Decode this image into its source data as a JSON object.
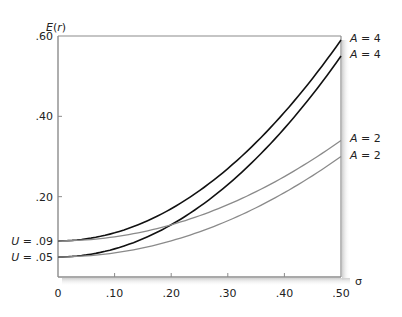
{
  "chart_data": {
    "type": "line",
    "title": "",
    "xlabel": "σ",
    "ylabel": "E(r)",
    "xlim": [
      0,
      0.5
    ],
    "ylim": [
      0,
      0.6
    ],
    "grid": false,
    "legend": "inline labels at right end of each curve",
    "x_ticks": [
      {
        "value": 0,
        "label": "0"
      },
      {
        "value": 0.1,
        "label": ".10"
      },
      {
        "value": 0.2,
        "label": ".20"
      },
      {
        "value": 0.3,
        "label": ".30"
      },
      {
        "value": 0.4,
        "label": ".40"
      },
      {
        "value": 0.5,
        "label": ".50"
      }
    ],
    "y_ticks": [
      {
        "value": 0.2,
        "label": ".20"
      },
      {
        "value": 0.4,
        "label": ".40"
      },
      {
        "value": 0.6,
        "label": ".60"
      }
    ],
    "intercept_labels": [
      {
        "value": 0.09,
        "label": "U = .09"
      },
      {
        "value": 0.05,
        "label": "U = .05"
      }
    ],
    "formula": "E(r) = U + 0.5 * A * σ^2",
    "x": [
      0,
      0.05,
      0.1,
      0.15,
      0.2,
      0.25,
      0.3,
      0.35,
      0.4,
      0.45,
      0.5
    ],
    "series": [
      {
        "name": "A = 4",
        "A": 4,
        "U": 0.09,
        "color": "#111111",
        "values": [
          0.09,
          0.095,
          0.11,
          0.135,
          0.17,
          0.215,
          0.27,
          0.335,
          0.41,
          0.495,
          0.59
        ]
      },
      {
        "name": "A = 4",
        "A": 4,
        "U": 0.05,
        "color": "#111111",
        "values": [
          0.05,
          0.055,
          0.07,
          0.095,
          0.13,
          0.175,
          0.23,
          0.295,
          0.37,
          0.455,
          0.55
        ]
      },
      {
        "name": "A = 2",
        "A": 2,
        "U": 0.09,
        "color": "#8a8a8a",
        "values": [
          0.09,
          0.0925,
          0.1,
          0.1125,
          0.13,
          0.1525,
          0.18,
          0.2125,
          0.25,
          0.2925,
          0.34
        ]
      },
      {
        "name": "A = 2",
        "A": 2,
        "U": 0.05,
        "color": "#8a8a8a",
        "values": [
          0.05,
          0.0525,
          0.06,
          0.0725,
          0.09,
          0.1125,
          0.14,
          0.1725,
          0.21,
          0.2525,
          0.3
        ]
      }
    ]
  },
  "labels": {
    "y_axis_title_E": "E",
    "y_axis_title_rest": "(r)",
    "x_axis_title": "σ",
    "curve_A_symbol": "A",
    "curve_4_suffix": " = 4",
    "curve_2_suffix": " = 2",
    "u_symbol": "U",
    "u09_suffix": " = .09",
    "u05_suffix": " = .05"
  },
  "colors": {
    "axis": "#8c8c8c",
    "dark_curve": "#111111",
    "light_curve": "#8a8a8a"
  }
}
